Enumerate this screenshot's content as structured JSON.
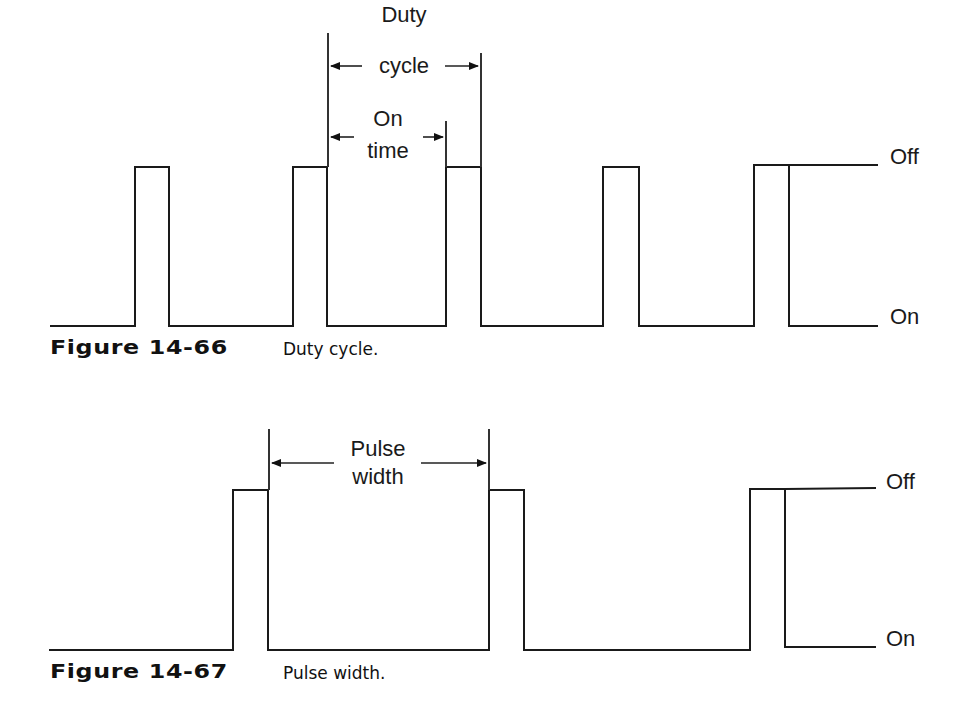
{
  "figures": [
    {
      "id": "fig-14-66",
      "caption_number": "Figure 14-66",
      "caption_text": "Duty cycle.",
      "level_labels": {
        "off": "Off",
        "on": "On"
      },
      "annotations": [
        {
          "label_line1": "Duty",
          "label_line2": "cycle"
        },
        {
          "label_line1": "On",
          "label_line2": "time"
        }
      ]
    },
    {
      "id": "fig-14-67",
      "caption_number": "Figure 14-67",
      "caption_text": "Pulse width.",
      "level_labels": {
        "off": "Off",
        "on": "On"
      },
      "annotations": [
        {
          "label_line1": "Pulse",
          "label_line2": "width"
        }
      ]
    }
  ],
  "colors": {
    "stroke": "#1a1a1a",
    "background": "#ffffff"
  }
}
